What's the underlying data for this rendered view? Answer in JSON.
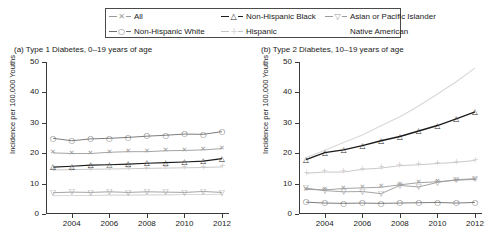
{
  "legend": {
    "items": [
      {
        "label": "All",
        "marker": "x",
        "color": "#9a9a9a",
        "key": "all"
      },
      {
        "label": "Non-Hispanic Black",
        "marker": "triangle",
        "color": "#1c1c1c",
        "key": "nhblack"
      },
      {
        "label": "Asian or Pacific Islander",
        "marker": "triangle-down",
        "color": "#9a9a9a",
        "key": "asianpi"
      },
      {
        "label": "Non-Hispanic White",
        "marker": "circle",
        "color": "#6e6e6e",
        "key": "nhwhite"
      },
      {
        "label": "Hispanic",
        "marker": "plus",
        "color": "#c3c3c3",
        "key": "hispanic"
      },
      {
        "label": "Native American",
        "marker": "none",
        "color": "#d8d8d8",
        "key": "native"
      }
    ]
  },
  "chart_data": [
    {
      "type": "line",
      "panel": "a",
      "title": "(a) Type 1 Diabetes, 0–19 years of age",
      "xlabel": "",
      "ylabel": "Incidence per 100,000 Youths",
      "x": [
        2003,
        2004,
        2005,
        2006,
        2007,
        2008,
        2009,
        2010,
        2011,
        2012
      ],
      "xticks": [
        2004,
        2006,
        2008,
        2010,
        2012
      ],
      "xlim": [
        2003,
        2012
      ],
      "ylim": [
        0,
        50
      ],
      "yticks": [
        0,
        10,
        20,
        30,
        40,
        50
      ],
      "grid": false,
      "legend_position": "top",
      "series": [
        {
          "name": "Non-Hispanic White",
          "marker": "circle",
          "color": "#6e6e6e",
          "values": [
            24.9,
            24.1,
            24.7,
            24.9,
            25.2,
            25.6,
            25.9,
            26.3,
            26.2,
            27.1
          ]
        },
        {
          "name": "All",
          "marker": "x",
          "color": "#9a9a9a",
          "values": [
            20.1,
            19.9,
            19.9,
            20.3,
            20.5,
            20.5,
            20.8,
            20.9,
            21.1,
            21.5
          ]
        },
        {
          "name": "Non-Hispanic Black",
          "marker": "triangle",
          "color": "#1c1c1c",
          "values": [
            15.4,
            15.7,
            16.1,
            16.2,
            16.4,
            16.7,
            16.9,
            17.1,
            17.4,
            18.2
          ]
        },
        {
          "name": "Hispanic",
          "marker": "plus",
          "color": "#c3c3c3",
          "values": [
            14.5,
            14.6,
            14.7,
            14.8,
            14.9,
            15.0,
            15.1,
            15.2,
            15.3,
            15.5
          ]
        },
        {
          "name": "Asian or Pacific Islander",
          "marker": "triangle-down",
          "color": "#9a9a9a",
          "values": [
            7.0,
            7.2,
            7.1,
            7.3,
            7.1,
            7.3,
            7.2,
            7.1,
            7.4,
            7.1
          ]
        },
        {
          "name": "Native American",
          "marker": "none",
          "color": "#d8d8d8",
          "values": [
            6.0,
            6.1,
            6.1,
            6.2,
            6.2,
            6.3,
            6.3,
            6.4,
            6.4,
            6.5
          ]
        }
      ]
    },
    {
      "type": "line",
      "panel": "b",
      "title": "(b) Type 2 Diabetes, 10–19 years of age",
      "xlabel": "",
      "ylabel": "Incidence per 100,000 Youths",
      "x": [
        2003,
        2004,
        2005,
        2006,
        2007,
        2008,
        2009,
        2010,
        2011,
        2012
      ],
      "xticks": [
        2004,
        2006,
        2008,
        2010,
        2012
      ],
      "xlim": [
        2003,
        2012
      ],
      "ylim": [
        0,
        50
      ],
      "yticks": [
        0,
        10,
        20,
        30,
        40,
        50
      ],
      "grid": false,
      "legend_position": "top",
      "series": [
        {
          "name": "Non-Hispanic Black",
          "marker": "triangle",
          "color": "#1c1c1c",
          "values": [
            17.9,
            20.2,
            21.1,
            22.5,
            24.1,
            25.5,
            27.3,
            29.1,
            31.3,
            33.6
          ]
        },
        {
          "name": "Native American",
          "marker": "none",
          "color": "#d8d8d8",
          "values": [
            18.5,
            21.0,
            23.5,
            26.0,
            29.0,
            32.0,
            35.5,
            39.5,
            43.5,
            48.0
          ]
        },
        {
          "name": "Hispanic",
          "marker": "plus",
          "color": "#c3c3c3",
          "values": [
            13.4,
            13.8,
            13.8,
            14.7,
            15.1,
            15.9,
            16.2,
            16.6,
            17.0,
            17.6
          ]
        },
        {
          "name": "Asian or Pacific Islander",
          "marker": "triangle-down",
          "color": "#9a9a9a",
          "values": [
            8.5,
            7.7,
            7.3,
            7.4,
            6.7,
            9.4,
            8.9,
            10.4,
            11.3,
            11.6
          ]
        },
        {
          "name": "All",
          "marker": "x",
          "color": "#9a9a9a",
          "values": [
            8.1,
            7.9,
            8.4,
            8.6,
            8.8,
            9.6,
            10.3,
            10.6,
            11.1,
            11.4
          ]
        },
        {
          "name": "Non-Hispanic White",
          "marker": "circle",
          "color": "#6e6e6e",
          "values": [
            3.9,
            3.6,
            3.5,
            3.6,
            3.5,
            3.6,
            3.7,
            3.8,
            3.6,
            3.8
          ]
        }
      ]
    }
  ]
}
